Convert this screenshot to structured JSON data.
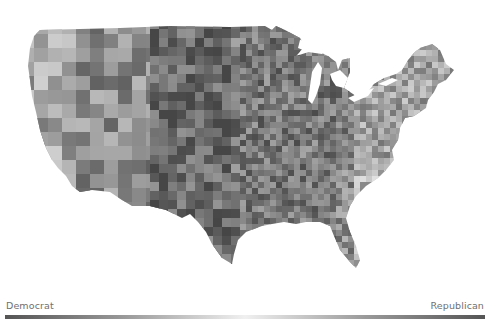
{
  "map": {
    "title": "",
    "subject": "US counties choropleth",
    "fill_scheme": "grayscale diverging (dark → light → dark)",
    "background_color": "#ffffff"
  },
  "legend": {
    "left_label": "Democrat",
    "right_label": "Republican",
    "gradient_stops": [
      "#555555",
      "#9a9a9a",
      "#f0f0f0",
      "#9a9a9a",
      "#555555"
    ]
  },
  "chart_data": {
    "type": "heatmap",
    "title": "",
    "geography": "United States counties (contiguous)",
    "color_scale": {
      "min_label": "Democrat",
      "max_label": "Republican",
      "colors": [
        "#555555",
        "#f0f0f0",
        "#555555"
      ]
    },
    "legend_position": "bottom",
    "grid": false
  }
}
